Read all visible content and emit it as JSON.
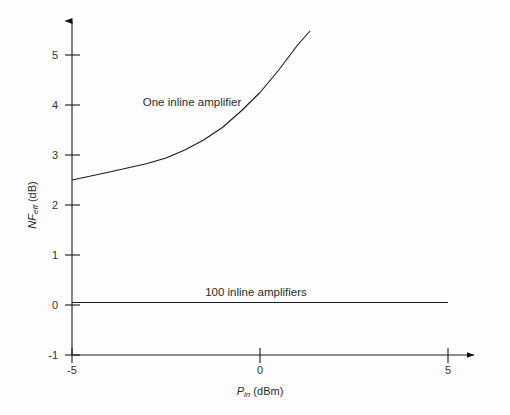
{
  "chart_data": {
    "type": "line",
    "title": "",
    "xlabel": "P_in (dBm)",
    "ylabel": "NF_eff (dB)",
    "xlim": [
      -5,
      5
    ],
    "ylim": [
      -1,
      5.6
    ],
    "xticks": [
      -5,
      0,
      5
    ],
    "xtick_labels": [
      "-5",
      "0",
      "5"
    ],
    "yticks": [
      -1,
      0,
      1,
      2,
      3,
      4,
      5
    ],
    "ytick_labels": [
      "-1",
      "0",
      "1",
      "2",
      "3",
      "4",
      "5"
    ],
    "grid": false,
    "legend": "none",
    "axis_style": "arrow-terminated L-axes, origin at bottom-left corner (-5,-1)",
    "series": [
      {
        "name": "One inline amplifier",
        "annotation": "One inline amplifier",
        "x": [
          -5,
          -4,
          -3,
          -2.5,
          -2,
          -1.5,
          -1,
          -0.5,
          0,
          0.5,
          1,
          1.33
        ],
        "values": [
          2.5,
          2.66,
          2.83,
          2.94,
          3.1,
          3.3,
          3.55,
          3.88,
          4.25,
          4.7,
          5.2,
          5.48
        ]
      },
      {
        "name": "100 inline amplifiers",
        "annotation": "100 inline amplifiers",
        "x": [
          -5,
          5
        ],
        "values": [
          0.05,
          0.05
        ]
      }
    ],
    "annotations": [
      {
        "text": "One inline amplifier",
        "x": -0.7,
        "y": 4.08
      },
      {
        "text": "100 inline amplifiers",
        "x": -0.1,
        "y": 0.32
      }
    ],
    "colors": {
      "background": "#fdfdfd",
      "axis": "#1a1a1a",
      "curve": "#1a1a1a",
      "text": "#2b2b2b"
    }
  },
  "axis_titles": {
    "x_symbol": "P",
    "x_subscript": "in",
    "x_unit": " (dBm)",
    "y_symbol": "NF",
    "y_subscript": "eff",
    "y_unit": " (dB)"
  },
  "labels": {
    "one_amp": "One inline amplifier",
    "hundred_amps": "100 inline amplifiers",
    "xt0": "-5",
    "xt1": "0",
    "xt2": "5",
    "yt0": "-1",
    "yt1": "0",
    "yt2": "1",
    "yt3": "2",
    "yt4": "3",
    "yt5": "4",
    "yt6": "5"
  }
}
